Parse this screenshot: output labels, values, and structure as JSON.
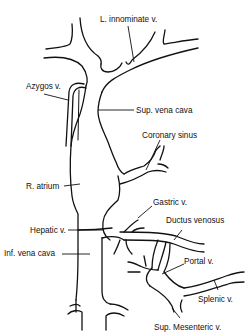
{
  "figure": {
    "labels": {
      "l_innominate": "L. innominate v.",
      "azygos": "Azygos v.",
      "sup_vena_cava": "Sup. vena cava",
      "coronary_sinus": "Coronary sinus",
      "r_atrium": "R. atrium",
      "gastric": "Gastric v.",
      "ductus_venosus": "Ductus venosus",
      "hepatic": "Hepatic v.",
      "inf_vena_cava": "Inf. vena cava",
      "portal": "Portal v.",
      "splenic": "Splenic v.",
      "sup_mesenteric": "Sup. Mesenteric v."
    },
    "colors": {
      "line": "#111111",
      "background": "#ffffff"
    }
  }
}
